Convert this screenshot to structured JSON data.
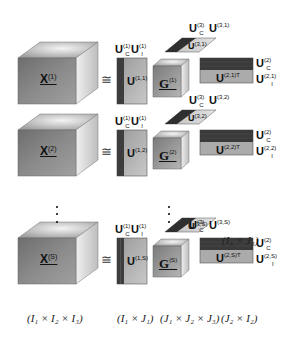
{
  "colors": {
    "cube_front": "#7f7f7f",
    "cube_top": "#bcbcbc",
    "cube_side": "#d9d9d9",
    "matrix_dark": "#3a3a3a",
    "matrix_light": "#a8a8a8",
    "text": "#111111"
  },
  "symbols": {
    "congruent": "≅",
    "vertical_ellipsis": "⋮"
  },
  "rows": [
    {
      "tensor": {
        "base": "X",
        "sup": "(1)"
      },
      "u1_common": {
        "base": "U",
        "sub": "C",
        "sup": "(1)"
      },
      "u1_indiv": {
        "base": "U",
        "sub": "I",
        "sup": "(1)"
      },
      "u1_body": {
        "base": "U",
        "sup": "(1,1)"
      },
      "core": {
        "base": "G",
        "sup": "(1)"
      },
      "u3_common": {
        "base": "U",
        "sub": "C",
        "sup": "(3)"
      },
      "u3_label": {
        "base": "U",
        "sup": "(3,1)"
      },
      "u3_body": {
        "base": "U",
        "sup": "(3,1)"
      },
      "u2_body": {
        "base": "U",
        "sup": "(2,1)T"
      },
      "u2_common": {
        "base": "U",
        "sub": "C",
        "sup": "(2)"
      },
      "u2_indiv": {
        "base": "U",
        "sub": "I",
        "sup": "(2,1)"
      }
    },
    {
      "tensor": {
        "base": "X",
        "sup": "(2)"
      },
      "u1_common": {
        "base": "U",
        "sub": "C",
        "sup": "(1)"
      },
      "u1_indiv": {
        "base": "U",
        "sub": "I",
        "sup": "(1)"
      },
      "u1_body": {
        "base": "U",
        "sup": "(1,2)"
      },
      "core": {
        "base": "G",
        "sup": "(2)"
      },
      "u3_common": {
        "base": "U",
        "sub": "C",
        "sup": "(3)"
      },
      "u3_label": {
        "base": "U",
        "sup": "(3,2)"
      },
      "u3_body": {
        "base": "U",
        "sup": "(3,2)"
      },
      "u2_body": {
        "base": "U",
        "sup": "(2,2)T"
      },
      "u2_common": {
        "base": "U",
        "sub": "C",
        "sup": "(2)"
      },
      "u2_indiv": {
        "base": "U",
        "sub": "I",
        "sup": "(2,2)"
      }
    },
    {
      "tensor": {
        "base": "X",
        "sup": "(S)"
      },
      "u1_common": {
        "base": "U",
        "sub": "C",
        "sup": "(1)"
      },
      "u1_indiv": {
        "base": "U",
        "sub": "I",
        "sup": "(1)"
      },
      "u1_body": {
        "base": "U",
        "sup": "(1,S)"
      },
      "core": {
        "base": "G",
        "sup": "(S)"
      },
      "u3_common": {
        "base": "U",
        "sub": "C",
        "sup": "(3)"
      },
      "u3_label": {
        "base": "U",
        "sup": "(3,S)"
      },
      "u3_body": {
        "base": "U",
        "sup": "(3,S)"
      },
      "u2_body": {
        "base": "U",
        "sup": "(2,S)T"
      },
      "u2_common": {
        "base": "U",
        "sub": "C",
        "sup": "(2)"
      },
      "u2_indiv": {
        "base": "U",
        "sub": "I",
        "sup": "(2,S)"
      }
    }
  ],
  "dimensions": {
    "tensor": "(I₁ × I₂ × I₃)",
    "u1": "(I₁ × J₁)",
    "core": "(J₁ × J₂ × J₃)",
    "u2": "(J₂ × I₂)",
    "u3": "(I₃ × J₃)"
  }
}
